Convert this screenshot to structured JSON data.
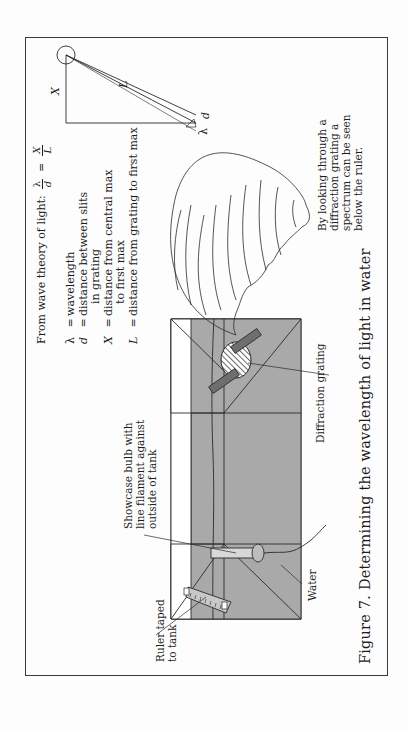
{
  "figure": {
    "caption": "Figure 7.  Determining the wavelength of light in water",
    "colors": {
      "water": "#a9a9a9",
      "grating_holder": "#6e6e6e",
      "line": "#2a2a2a",
      "frame": "#3a3a3a"
    },
    "labels": {
      "ruler": [
        "Ruler taped",
        "to tank"
      ],
      "bulb": [
        "Showcase bulb with",
        "line filament against",
        "outside of tank"
      ],
      "water": "Water",
      "grating": "Diffraction grating",
      "observer": [
        "By looking through a",
        "diffraction grating a",
        "spectrum can be seen",
        "below the ruler."
      ]
    },
    "theory": {
      "intro": "From wave theory of light:",
      "equation": {
        "lhs_num": "λ",
        "lhs_den": "d",
        "equals": "=",
        "rhs_num": "X",
        "rhs_den": "L"
      },
      "definitions": [
        {
          "symbol": "λ",
          "eq": "=",
          "text": "wavelength"
        },
        {
          "symbol": "d",
          "eq": "=",
          "text": "distance between slits"
        },
        {
          "symbol": "",
          "eq": "",
          "text": "in grating"
        },
        {
          "symbol": "X",
          "eq": "=",
          "text": "distance from central max"
        },
        {
          "symbol": "",
          "eq": "",
          "text": "to first max"
        },
        {
          "symbol": "L",
          "eq": "=",
          "text": "distance from grating to first max"
        }
      ]
    },
    "diagram": {
      "x_label": "X",
      "l_label": "L",
      "lambda_label": "λ",
      "d_label": "d"
    }
  }
}
